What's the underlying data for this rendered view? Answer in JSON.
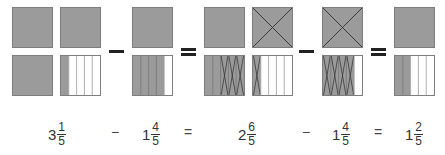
{
  "colors": {
    "shaded": "#9b9b9b",
    "border": "#7d7d7d",
    "strike": "#3a3a3a",
    "operator": "#222222"
  },
  "parts_per_whole": 5,
  "pictorial": [
    {
      "id": "g1",
      "top": {
        "squares": [
          {
            "type": "whole",
            "crossed": false
          },
          {
            "type": "whole",
            "crossed": false
          }
        ]
      },
      "bottom": {
        "squares": [
          {
            "type": "whole",
            "crossed": false
          },
          {
            "type": "strips",
            "shaded": 1,
            "crossed": 0
          }
        ]
      }
    },
    {
      "id": "g2",
      "top": {
        "squares": [
          {
            "type": "whole",
            "crossed": false
          }
        ]
      },
      "bottom": {
        "squares": [
          {
            "type": "strips",
            "shaded": 4,
            "crossed": 0
          }
        ]
      }
    },
    {
      "id": "g3",
      "top": {
        "squares": [
          {
            "type": "whole",
            "crossed": false
          },
          {
            "type": "whole",
            "crossed": true
          }
        ]
      },
      "bottom": {
        "squares": [
          {
            "type": "strips",
            "shaded": 5,
            "crossed_from": 2,
            "crossed": 3
          },
          {
            "type": "strips",
            "shaded": 1,
            "crossed_from": 0,
            "crossed": 1
          }
        ]
      }
    },
    {
      "id": "g4",
      "top": {
        "squares": [
          {
            "type": "whole",
            "crossed": true
          }
        ]
      },
      "bottom": {
        "squares": [
          {
            "type": "strips",
            "shaded": 4,
            "crossed_from": 0,
            "crossed": 4
          }
        ]
      }
    },
    {
      "id": "g5",
      "top": {
        "squares": [
          {
            "type": "whole",
            "crossed": false
          }
        ]
      },
      "bottom": {
        "squares": [
          {
            "type": "strips",
            "shaded": 2,
            "crossed": 0
          }
        ]
      }
    }
  ],
  "operators": [
    "−",
    "=",
    "−",
    "="
  ],
  "equation": {
    "terms": [
      {
        "whole": "3",
        "numerator": "1",
        "denominator": "5"
      },
      {
        "whole": "1",
        "numerator": "4",
        "denominator": "5"
      },
      {
        "whole": "2",
        "numerator": "6",
        "denominator": "5"
      },
      {
        "whole": "1",
        "numerator": "4",
        "denominator": "5"
      },
      {
        "whole": "1",
        "numerator": "2",
        "denominator": "5"
      }
    ],
    "operators": [
      "−",
      "=",
      "−",
      "="
    ]
  }
}
